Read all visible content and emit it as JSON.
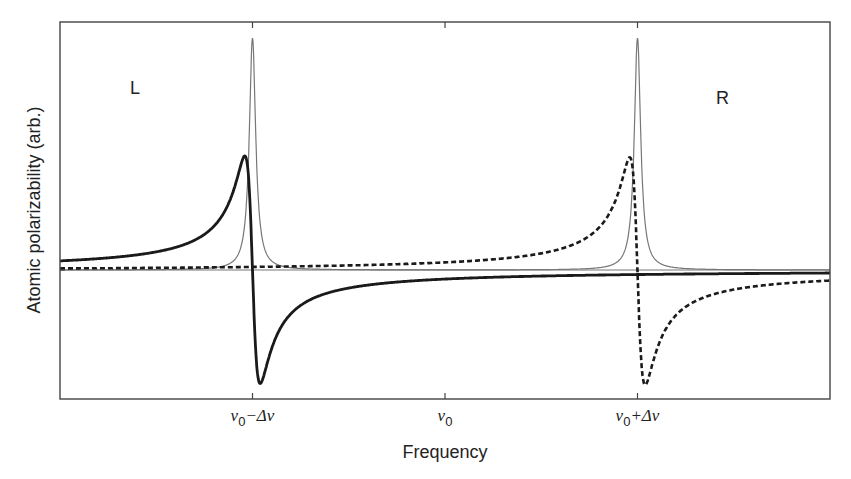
{
  "chart_data": {
    "type": "line",
    "title": "",
    "xlabel": "Frequency",
    "ylabel": "Atomic polarizability (arb.)",
    "x_ticks": [
      {
        "label_main": "ν",
        "label_sub": "0",
        "label_rest": "−Δν",
        "x": -1
      },
      {
        "label_main": "ν",
        "label_sub": "0",
        "label_rest": "",
        "x": 0
      },
      {
        "label_main": "ν",
        "label_sub": "0",
        "label_rest": "+Δν",
        "x": 1
      }
    ],
    "xlim": [
      -2.0,
      2.0
    ],
    "ylim": [
      -1.0,
      1.85
    ],
    "grid": false,
    "legend": null,
    "annotations": [
      {
        "text": "L",
        "x": -1.5,
        "y": 1.45
      },
      {
        "text": "R",
        "x": 1.45,
        "y": 1.45
      }
    ],
    "series": [
      {
        "name": "absorption (Lorentzian)",
        "style": "thin-gray",
        "center": -1,
        "width": 0.02,
        "kind": "absorption",
        "peak": 1.83
      },
      {
        "name": "absorption (Lorentzian)",
        "style": "thin-gray",
        "center": 1,
        "width": 0.02,
        "kind": "absorption",
        "peak": 1.83
      },
      {
        "name": "L dispersion",
        "style": "thick-solid",
        "center": -1,
        "width": 0.04,
        "kind": "dispersion",
        "peak": 0.9
      },
      {
        "name": "R dispersion",
        "style": "thick-dashed",
        "center": 1,
        "width": 0.04,
        "kind": "dispersion",
        "peak": 0.9
      }
    ]
  }
}
